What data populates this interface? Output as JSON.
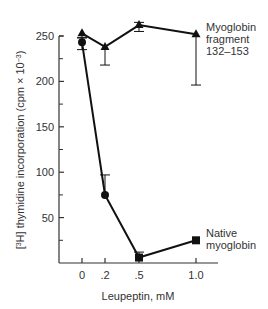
{
  "chart_data": {
    "type": "line",
    "title": "",
    "xlabel": "Leupeptin, mM",
    "ylabel": "[3H] thymidine incorporation (cpm × 10^-3)",
    "ylabel_parts": {
      "open": "[",
      "sup": "3",
      "main": "H] thymidine incorporation (cpm × 10",
      "exp": "−3",
      "close": ")"
    },
    "x": [
      0,
      0.2,
      0.5,
      1.0
    ],
    "x_tick_labels": [
      "0",
      ".2",
      ".5",
      "1.0"
    ],
    "y_ticks": [
      50,
      100,
      150,
      200,
      250
    ],
    "y_tick_labels": [
      "50",
      "100",
      "150",
      "200",
      "250"
    ],
    "ylim": [
      0,
      250
    ],
    "grid": false,
    "legend_position": "inline-right",
    "series": [
      {
        "name": "Myoglobin fragment 132–153",
        "label_lines": [
          "Myoglobin",
          "fragment",
          "132–153"
        ],
        "marker": "triangle",
        "values": [
          253,
          238,
          262,
          252
        ],
        "error_low": [
          248,
          218,
          255,
          196
        ],
        "error_high": [
          253,
          238,
          265,
          252
        ]
      },
      {
        "name": "Native myoglobin",
        "label_lines": [
          "Native",
          "myoglobin"
        ],
        "marker": [
          "circle",
          "circle",
          "square",
          "square"
        ],
        "values": [
          243,
          75,
          6,
          25
        ],
        "error_low": [
          235,
          75,
          6,
          25
        ],
        "error_high": [
          248,
          97,
          12,
          25
        ]
      }
    ]
  },
  "colors": {
    "line": "#111111",
    "text": "#333333",
    "axis": "#333333"
  }
}
